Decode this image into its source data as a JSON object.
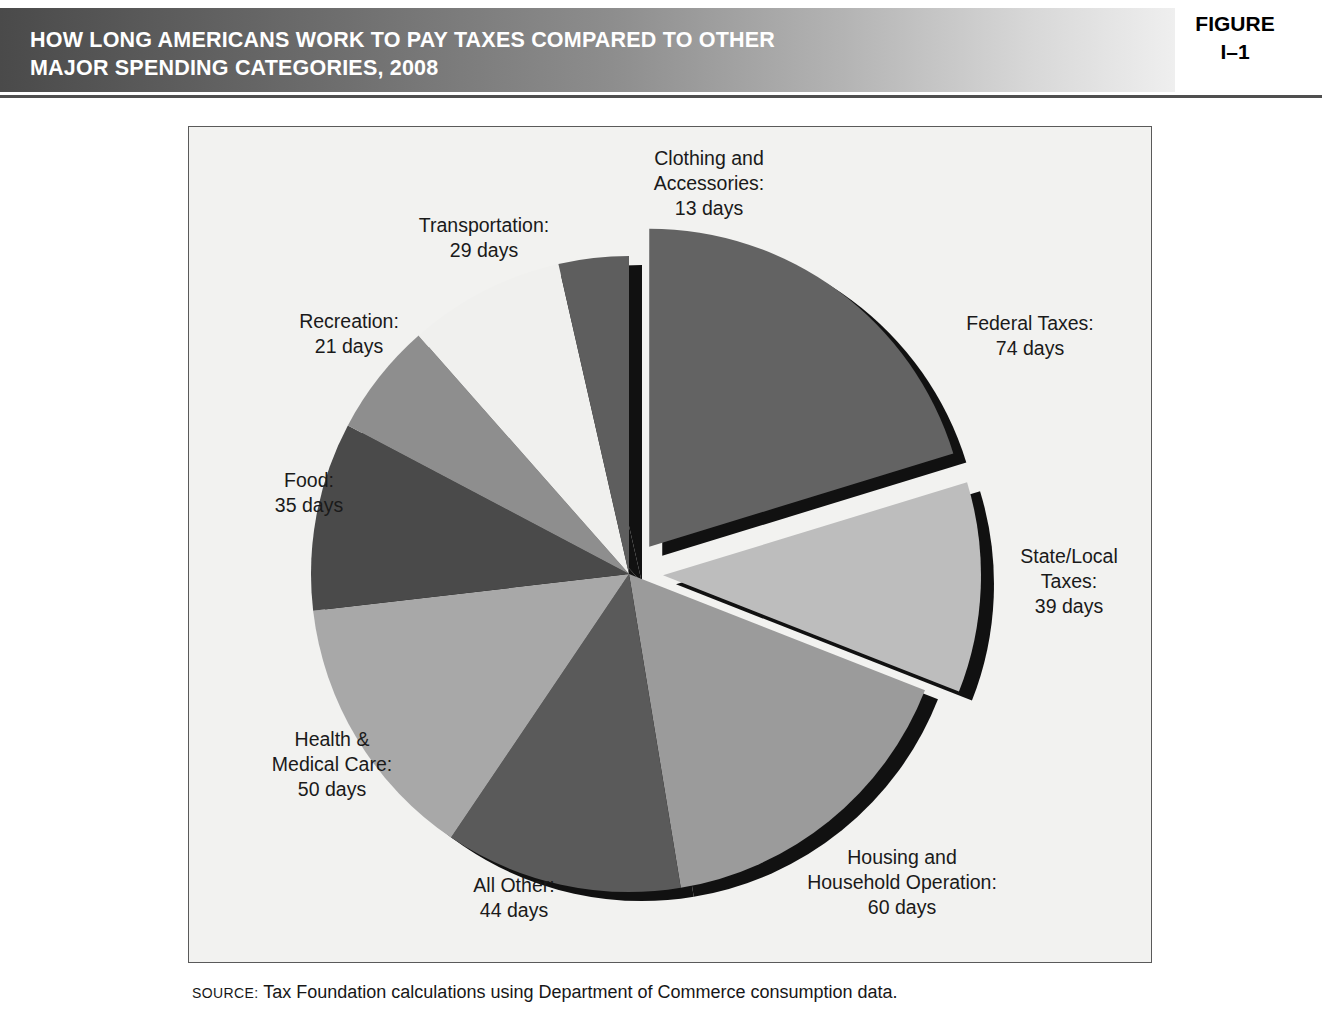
{
  "header": {
    "title_line1": "HOW LONG AMERICANS WORK TO PAY TAXES COMPARED TO OTHER",
    "title_line2": "MAJOR SPENDING CATEGORIES, 2008",
    "figure_word": "FIGURE",
    "figure_number": "I–1"
  },
  "source": {
    "label": "SOURCE:",
    "text": " Tax Foundation calculations using Department of Commerce consumption data."
  },
  "labels": {
    "federal": "Federal Taxes:\n74 days",
    "federal_l1": "Federal Taxes:",
    "federal_l2": "74 days",
    "state_l1": "State/Local",
    "state_l2": "Taxes:",
    "state_l3": "39 days",
    "housing_l1": "Housing and",
    "housing_l2": "Household Operation:",
    "housing_l3": "60 days",
    "allother_l1": "All Other:",
    "allother_l2": "44 days",
    "health_l1": "Health &",
    "health_l2": "Medical Care:",
    "health_l3": "50 days",
    "food_l1": "Food:",
    "food_l2": "35 days",
    "recreation_l1": "Recreation:",
    "recreation_l2": "21 days",
    "transportation_l1": "Transportation:",
    "transportation_l2": "29 days",
    "clothing_l1": "Clothing and",
    "clothing_l2": "Accessories:",
    "clothing_l3": "13 days"
  },
  "chart_data": {
    "type": "pie",
    "title": "HOW LONG AMERICANS WORK TO PAY TAXES COMPARED TO OTHER MAJOR SPENDING CATEGORIES, 2008",
    "unit": "days",
    "total": 365,
    "start_angle_deg": 0,
    "direction": "clockwise",
    "legend": "none (direct labels)",
    "grid": false,
    "categories": [
      "Federal Taxes",
      "State/Local Taxes",
      "Housing and Household Operation",
      "All Other",
      "Health & Medical Care",
      "Food",
      "Recreation",
      "Transportation",
      "Clothing and Accessories"
    ],
    "values": [
      74,
      39,
      60,
      44,
      50,
      35,
      21,
      29,
      13
    ],
    "slices": [
      {
        "label": "Federal Taxes",
        "value": 74,
        "unit_text": "74 days",
        "color": "#636363",
        "exploded": true
      },
      {
        "label": "State/Local Taxes",
        "value": 39,
        "unit_text": "39 days",
        "color": "#bdbdbd",
        "exploded": true
      },
      {
        "label": "Housing and Household Operation",
        "value": 60,
        "unit_text": "60 days",
        "color": "#9b9b9b",
        "exploded": false
      },
      {
        "label": "All Other",
        "value": 44,
        "unit_text": "44 days",
        "color": "#5a5a5a",
        "exploded": false
      },
      {
        "label": "Health & Medical Care",
        "value": 50,
        "unit_text": "50 days",
        "color": "#a8a8a8",
        "exploded": false
      },
      {
        "label": "Food",
        "value": 35,
        "unit_text": "35 days",
        "color": "#4a4a4a",
        "exploded": false
      },
      {
        "label": "Recreation",
        "value": 21,
        "unit_text": "21 days",
        "color": "#8e8e8e",
        "exploded": false
      },
      {
        "label": "Transportation",
        "value": 29,
        "unit_text": "29 days",
        "color": "#f0f0ee",
        "exploded": false
      },
      {
        "label": "Clothing and Accessories",
        "value": 13,
        "unit_text": "13 days",
        "color": "#5e5e5e",
        "exploded": false
      }
    ],
    "colors": {
      "panel_background": "#f2f2f0",
      "panel_border": "#5a5a5a",
      "shadow": "#111111",
      "header_dark": "#4a4a4a",
      "header_light": "#efefef"
    }
  }
}
